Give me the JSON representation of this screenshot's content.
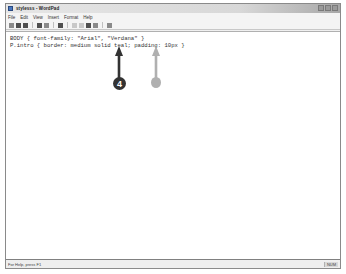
{
  "window": {
    "title": "stylesss - WordPad",
    "controls": [
      "minimize",
      "maximize",
      "close"
    ]
  },
  "menubar": {
    "items": [
      "File",
      "Edit",
      "View",
      "Insert",
      "Format",
      "Help"
    ]
  },
  "toolbar": {
    "buttons": [
      "new",
      "open",
      "save",
      "print",
      "print-preview",
      "find",
      "cut",
      "copy",
      "paste",
      "undo",
      "date-time"
    ]
  },
  "document": {
    "lines": [
      "BODY { font-family: \"Arial\", \"Verdana\" }",
      "P.intro { border: medium solid teal; padding: 10px }"
    ]
  },
  "statusbar": {
    "help_text": "For Help, press F1",
    "mode": "NUM"
  },
  "callouts": [
    {
      "label": "4",
      "color": "#333333",
      "target": "teal"
    },
    {
      "label": "",
      "color": "#b0b0b0",
      "target": "padding"
    }
  ]
}
